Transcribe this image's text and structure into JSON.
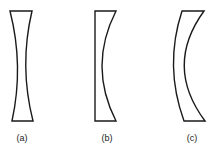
{
  "figure": {
    "stroke_color": "#1a1a1a",
    "background": "#ffffff",
    "lenses": [
      {
        "id": "a",
        "label": "(a)",
        "type": "biconcave"
      },
      {
        "id": "b",
        "label": "(b)",
        "type": "plano-concave"
      },
      {
        "id": "c",
        "label": "(c)",
        "type": "concave-convex meniscus"
      }
    ]
  }
}
